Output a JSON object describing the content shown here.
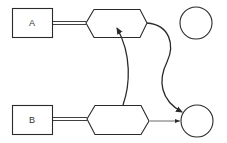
{
  "diagram": {
    "type": "flow-diagram",
    "colors": {
      "stroke": "#2a2a2a",
      "background": "#ffffff",
      "text": "#333333"
    },
    "nodes": [
      {
        "id": "box-a",
        "shape": "rectangle",
        "label": "A"
      },
      {
        "id": "box-b",
        "shape": "rectangle",
        "label": "B"
      },
      {
        "id": "hex-top",
        "shape": "hexagon",
        "label": ""
      },
      {
        "id": "hex-bottom",
        "shape": "hexagon",
        "label": ""
      },
      {
        "id": "circle-top",
        "shape": "circle",
        "label": ""
      },
      {
        "id": "circle-bottom",
        "shape": "circle",
        "label": ""
      }
    ],
    "edges": [
      {
        "from": "box-a",
        "to": "hex-top",
        "style": "double-line"
      },
      {
        "from": "box-b",
        "to": "hex-bottom",
        "style": "double-line"
      },
      {
        "from": "hex-bottom",
        "to": "hex-top",
        "style": "curved-arrow"
      },
      {
        "from": "hex-top",
        "to": "circle-bottom",
        "style": "s-curve-arrow"
      },
      {
        "from": "hex-bottom",
        "to": "circle-bottom",
        "style": "thin-arrow"
      }
    ],
    "labels": {
      "box_a": "A",
      "box_b": "B"
    }
  }
}
